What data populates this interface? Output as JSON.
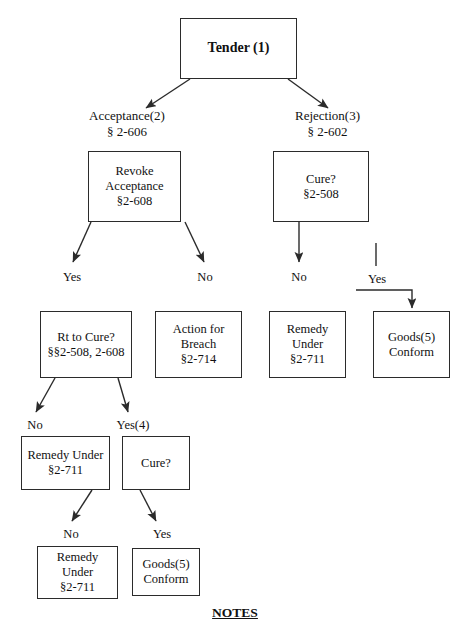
{
  "diagram": {
    "title_text": "Tender (1)",
    "footer": {
      "label": "NOTES"
    },
    "nodes": {
      "tender": {
        "lines": [
          "Tender (1)"
        ]
      },
      "revoke": {
        "lines": [
          "Revoke",
          "Acceptance",
          "§2-608"
        ]
      },
      "cure_right": {
        "lines": [
          "Cure?",
          "§2-508"
        ]
      },
      "rt_to_cure": {
        "lines": [
          "Rt to Cure?",
          "§§2-508, 2-608"
        ]
      },
      "action_breach": {
        "lines": [
          "Action for",
          "Breach",
          "§2-714"
        ]
      },
      "remedy_right": {
        "lines": [
          "Remedy",
          "Under",
          "§2-711"
        ]
      },
      "goods_conform_r": {
        "lines": [
          "Goods(5)",
          "Conform"
        ]
      },
      "remedy_mid": {
        "lines": [
          "Remedy Under",
          "§2-711"
        ]
      },
      "cure_low": {
        "lines": [
          "Cure?"
        ]
      },
      "remedy_bottom": {
        "lines": [
          "Remedy",
          "Under",
          "§2-711"
        ]
      },
      "goods_conform_b": {
        "lines": [
          "Goods(5)",
          "Conform"
        ]
      }
    },
    "branch_labels": {
      "acceptance": {
        "lines": [
          "Acceptance(2)",
          "§ 2-606"
        ]
      },
      "rejection": {
        "lines": [
          "Rejection(3)",
          "§ 2-602"
        ]
      }
    },
    "edge_labels": {
      "revoke_yes": "Yes",
      "revoke_no": "No",
      "cure_right_no": "No",
      "cure_right_yes": "Yes",
      "rt_cure_no": "No",
      "rt_cure_yes": "Yes(4)",
      "cure_low_no": "No",
      "cure_low_yes": "Yes"
    },
    "colors": {
      "stroke": "#2b2b2b",
      "text": "#111111",
      "background": "#ffffff"
    }
  }
}
